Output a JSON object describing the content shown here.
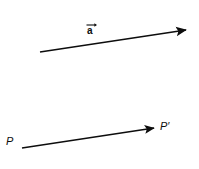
{
  "figure": {
    "background_color": "#ffffff",
    "stroke_color": "#0d0d0d",
    "text_color": "#0d0d0d",
    "width": 199,
    "height": 169,
    "vector_label": {
      "letter": "a",
      "notation": "arrow-over",
      "name": "vector-a-label"
    },
    "point_labels": {
      "start": "P",
      "end": "P",
      "end_prime_mark": "′"
    },
    "arrows": [
      {
        "name": "vector-a-arrow",
        "x1": 40,
        "y1": 52,
        "x2": 186,
        "y2": 30
      },
      {
        "name": "point-translation-arrow",
        "x1": 22,
        "y1": 148,
        "x2": 154,
        "y2": 128
      }
    ]
  }
}
